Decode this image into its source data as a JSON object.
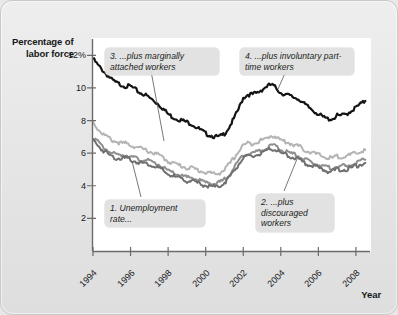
{
  "axes": {
    "y_title_line1": "Percentage of",
    "y_title_line2": "labor force",
    "x_title": "Year"
  },
  "callouts": {
    "c1": "1. Unemployment rate...",
    "c2": "2. ...plus discouraged workers",
    "c3": "3. ...plus marginally attached workers",
    "c4": "4. ...plus involuntary part-time workers"
  },
  "colors": {
    "series_u6": "#141414",
    "series_marginally_attached": "#b4b4b4",
    "series_discouraged": "#8e8e8e",
    "series_unemployment": "#6f6f6f",
    "plot_background": "#ffffff",
    "figure_background": "#e6e6e6",
    "axis": "#6b6b6b"
  },
  "chart_data": {
    "type": "line",
    "title": "",
    "xlabel": "Year",
    "ylabel": "Percentage of labor force",
    "xlim": [
      1994,
      2008.75
    ],
    "ylim": [
      0,
      13
    ],
    "grid": false,
    "legend_position": "inline-callouts",
    "ytick_labels": [
      "12%",
      "10",
      "8",
      "6",
      "4",
      "2"
    ],
    "ytick_values": [
      12,
      10,
      8,
      6,
      4,
      2
    ],
    "xtick_labels": [
      "1994",
      "1996",
      "1998",
      "2000",
      "2002",
      "2004",
      "2006",
      "2008"
    ],
    "xtick_values": [
      1994,
      1996,
      1998,
      2000,
      2002,
      2004,
      2006,
      2008
    ],
    "x": [
      1994.0,
      1994.25,
      1994.5,
      1994.75,
      1995.0,
      1995.25,
      1995.5,
      1995.75,
      1996.0,
      1996.25,
      1996.5,
      1996.75,
      1997.0,
      1997.25,
      1997.5,
      1997.75,
      1998.0,
      1998.25,
      1998.5,
      1998.75,
      1999.0,
      1999.25,
      1999.5,
      1999.75,
      2000.0,
      2000.25,
      2000.5,
      2000.75,
      2001.0,
      2001.25,
      2001.5,
      2001.75,
      2002.0,
      2002.25,
      2002.5,
      2002.75,
      2003.0,
      2003.25,
      2003.5,
      2003.75,
      2004.0,
      2004.25,
      2004.5,
      2004.75,
      2005.0,
      2005.25,
      2005.5,
      2005.75,
      2006.0,
      2006.25,
      2006.5,
      2006.75,
      2007.0,
      2007.25,
      2007.5,
      2007.75,
      2008.0,
      2008.25,
      2008.5
    ],
    "series": [
      {
        "name": "4. ...plus involuntary part-time workers",
        "callout": "c4",
        "color": "#141414",
        "values": [
          11.8,
          11.4,
          11.1,
          10.8,
          10.5,
          10.3,
          10.2,
          10.1,
          10.1,
          9.9,
          9.7,
          9.6,
          9.4,
          9.2,
          9.0,
          8.7,
          8.4,
          8.2,
          8.1,
          8.0,
          7.9,
          7.8,
          7.6,
          7.4,
          7.2,
          7.1,
          7.0,
          7.0,
          7.2,
          7.6,
          8.1,
          8.7,
          9.4,
          9.6,
          9.6,
          9.7,
          9.9,
          10.1,
          10.2,
          10.0,
          9.7,
          9.6,
          9.5,
          9.4,
          9.3,
          9.0,
          8.8,
          8.6,
          8.4,
          8.2,
          8.1,
          8.1,
          8.3,
          8.3,
          8.4,
          8.6,
          8.8,
          9.0,
          9.2
        ]
      },
      {
        "name": "3. ...plus marginally attached workers",
        "callout": "c3",
        "color": "#b4b4b4",
        "values": [
          7.9,
          7.5,
          7.2,
          7.0,
          6.8,
          6.7,
          6.6,
          6.6,
          6.5,
          6.4,
          6.3,
          6.2,
          6.1,
          6.0,
          5.9,
          5.7,
          5.5,
          5.4,
          5.3,
          5.2,
          5.1,
          5.1,
          5.0,
          4.9,
          4.8,
          4.8,
          4.7,
          4.8,
          5.0,
          5.3,
          5.7,
          6.1,
          6.5,
          6.6,
          6.6,
          6.7,
          6.8,
          6.9,
          7.1,
          7.0,
          6.8,
          6.7,
          6.6,
          6.5,
          6.4,
          6.2,
          6.1,
          6.0,
          5.9,
          5.8,
          5.7,
          5.7,
          5.8,
          5.8,
          5.8,
          5.9,
          6.0,
          6.1,
          6.2
        ]
      },
      {
        "name": "2. ...plus discouraged workers",
        "callout": "c2",
        "color": "#8e8e8e",
        "values": [
          7.0,
          6.7,
          6.4,
          6.2,
          6.0,
          5.9,
          5.9,
          5.9,
          5.8,
          5.7,
          5.6,
          5.6,
          5.5,
          5.4,
          5.3,
          5.1,
          4.9,
          4.8,
          4.7,
          4.6,
          4.5,
          4.5,
          4.4,
          4.3,
          4.2,
          4.2,
          4.1,
          4.2,
          4.4,
          4.7,
          5.1,
          5.5,
          5.9,
          6.0,
          6.0,
          6.1,
          6.2,
          6.3,
          6.5,
          6.4,
          6.2,
          6.1,
          6.0,
          5.9,
          5.8,
          5.6,
          5.5,
          5.4,
          5.3,
          5.2,
          5.1,
          5.1,
          5.2,
          5.2,
          5.2,
          5.3,
          5.4,
          5.5,
          5.6
        ]
      },
      {
        "name": "1. Unemployment rate...",
        "callout": "c1",
        "color": "#6f6f6f",
        "values": [
          6.8,
          6.5,
          6.2,
          6.0,
          5.8,
          5.7,
          5.7,
          5.7,
          5.6,
          5.5,
          5.4,
          5.4,
          5.3,
          5.2,
          5.1,
          4.9,
          4.7,
          4.6,
          4.5,
          4.4,
          4.3,
          4.3,
          4.2,
          4.1,
          4.0,
          4.0,
          3.9,
          4.0,
          4.2,
          4.5,
          4.9,
          5.3,
          5.7,
          5.8,
          5.8,
          5.9,
          6.0,
          6.1,
          6.3,
          6.2,
          6.0,
          5.9,
          5.8,
          5.7,
          5.6,
          5.4,
          5.3,
          5.2,
          5.1,
          5.0,
          4.9,
          4.9,
          5.0,
          5.0,
          5.0,
          5.1,
          5.2,
          5.3,
          5.4
        ]
      }
    ]
  }
}
